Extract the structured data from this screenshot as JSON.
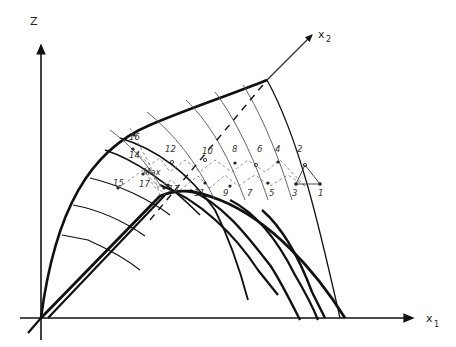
{
  "axes": {
    "z": {
      "label": "Z"
    },
    "x1": {
      "label": "x",
      "subscript": "1"
    },
    "x2": {
      "label": "x",
      "subscript": "2"
    }
  },
  "points": [
    {
      "id": "1",
      "label": "1"
    },
    {
      "id": "2",
      "label": "2"
    },
    {
      "id": "3",
      "label": "3"
    },
    {
      "id": "4",
      "label": "4"
    },
    {
      "id": "5",
      "label": "5"
    },
    {
      "id": "6",
      "label": "6"
    },
    {
      "id": "7",
      "label": "7"
    },
    {
      "id": "8",
      "label": "8"
    },
    {
      "id": "9",
      "label": "9"
    },
    {
      "id": "10",
      "label": "10"
    },
    {
      "id": "11",
      "label": "11"
    },
    {
      "id": "12",
      "label": "12"
    },
    {
      "id": "13",
      "label": "13"
    },
    {
      "id": "14",
      "label": "14"
    },
    {
      "id": "15",
      "label": "15"
    },
    {
      "id": "16",
      "label": "16"
    },
    {
      "id": "17",
      "label": "17"
    }
  ],
  "max_label": "Max",
  "colors": {
    "ink": "#111111",
    "thin": "#555555",
    "dash": "#777777",
    "background": "#ffffff"
  }
}
